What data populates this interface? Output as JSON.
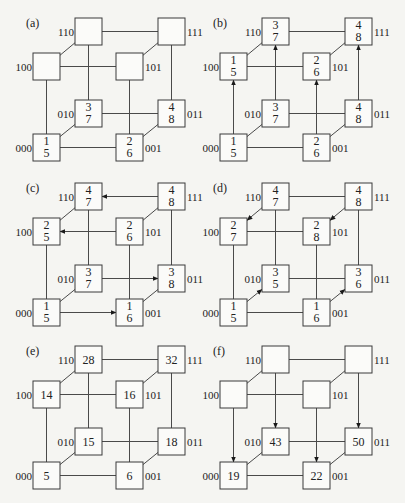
{
  "figure": {
    "colors": {
      "line": "#4a4a4a",
      "box_stroke": "#3a3a3a",
      "box_fill": "#fbfbf9",
      "text": "#222222",
      "background": "#f5f5f2"
    },
    "node_labels": [
      "000",
      "001",
      "010",
      "011",
      "100",
      "101",
      "110",
      "111"
    ],
    "panels": [
      {
        "id": "a",
        "label": "(a)",
        "values": {
          "000": [
            "1",
            "5"
          ],
          "001": [
            "2",
            "6"
          ],
          "010": [
            "3",
            "7"
          ],
          "011": [
            "4",
            "8"
          ],
          "100": [],
          "101": [],
          "110": [],
          "111": []
        },
        "arrows": []
      },
      {
        "id": "b",
        "label": "(b)",
        "values": {
          "000": [
            "1",
            "5"
          ],
          "001": [
            "2",
            "6"
          ],
          "010": [
            "3",
            "7"
          ],
          "011": [
            "4",
            "8"
          ],
          "100": [
            "1",
            "5"
          ],
          "101": [
            "2",
            "6"
          ],
          "110": [
            "3",
            "7"
          ],
          "111": [
            "4",
            "8"
          ]
        },
        "arrows": [
          [
            "000",
            "100"
          ],
          [
            "001",
            "101"
          ],
          [
            "010",
            "110"
          ],
          [
            "011",
            "111"
          ]
        ]
      },
      {
        "id": "c",
        "label": "(c)",
        "values": {
          "000": [
            "1",
            "5"
          ],
          "001": [
            "1",
            "6"
          ],
          "010": [
            "3",
            "7"
          ],
          "011": [
            "3",
            "8"
          ],
          "100": [
            "2",
            "5"
          ],
          "101": [
            "2",
            "6"
          ],
          "110": [
            "4",
            "7"
          ],
          "111": [
            "4",
            "8"
          ]
        },
        "arrows": [
          [
            "000",
            "001"
          ],
          [
            "010",
            "011"
          ],
          [
            "101",
            "100"
          ],
          [
            "111",
            "110"
          ]
        ]
      },
      {
        "id": "d",
        "label": "(d)",
        "values": {
          "000": [
            "1",
            "5"
          ],
          "001": [
            "1",
            "6"
          ],
          "010": [
            "3",
            "5"
          ],
          "011": [
            "3",
            "6"
          ],
          "100": [
            "2",
            "7"
          ],
          "101": [
            "2",
            "8"
          ],
          "110": [
            "4",
            "7"
          ],
          "111": [
            "4",
            "8"
          ]
        },
        "arrows": [
          [
            "000",
            "010"
          ],
          [
            "001",
            "011"
          ],
          [
            "110",
            "100"
          ],
          [
            "111",
            "101"
          ]
        ]
      },
      {
        "id": "e",
        "label": "(e)",
        "values": {
          "000": [
            "5"
          ],
          "001": [
            "6"
          ],
          "010": [
            "15"
          ],
          "011": [
            "18"
          ],
          "100": [
            "14"
          ],
          "101": [
            "16"
          ],
          "110": [
            "28"
          ],
          "111": [
            "32"
          ]
        },
        "arrows": []
      },
      {
        "id": "f",
        "label": "(f)",
        "values": {
          "000": [
            "19"
          ],
          "001": [
            "22"
          ],
          "010": [
            "43"
          ],
          "011": [
            "50"
          ],
          "100": [],
          "101": [],
          "110": [],
          "111": []
        },
        "arrows": [
          [
            "100",
            "000"
          ],
          [
            "101",
            "001"
          ],
          [
            "110",
            "010"
          ],
          [
            "111",
            "011"
          ]
        ]
      }
    ]
  }
}
